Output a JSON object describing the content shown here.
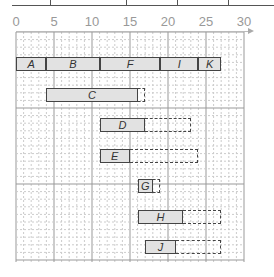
{
  "diagram": {
    "type": "gantt",
    "axis": {
      "ticks": [
        "0",
        "5",
        "10",
        "15",
        "20",
        "25",
        "30"
      ],
      "min": 0,
      "max": 30,
      "origin_px": 16,
      "px_per_unit": 7.6
    },
    "top_row": [
      {
        "label": "A",
        "start": 0,
        "end": 4
      },
      {
        "label": "B",
        "start": 4,
        "end": 11
      },
      {
        "label": "F",
        "start": 11,
        "end": 19
      },
      {
        "label": "I",
        "start": 19,
        "end": 24
      },
      {
        "label": "K",
        "start": 24,
        "end": 27
      }
    ],
    "tasks": [
      {
        "label": "C",
        "start": 4,
        "end": 16,
        "slack_end": 17
      },
      {
        "label": "D",
        "start": 11,
        "end": 17,
        "slack_end": 23
      },
      {
        "label": "E",
        "start": 11,
        "end": 15,
        "slack_end": 24
      },
      {
        "label": "G",
        "start": 16,
        "end": 18,
        "slack_end": 19
      },
      {
        "label": "H",
        "start": 16,
        "end": 22,
        "slack_end": 27
      },
      {
        "label": "J",
        "start": 17,
        "end": 21,
        "slack_end": 27
      }
    ],
    "colors": {
      "bar_fill": "#e2e2e2",
      "bar_border": "#444444",
      "grid_minor": "#cccccc",
      "grid_major": "#999999",
      "axis_text": "#999999"
    }
  }
}
